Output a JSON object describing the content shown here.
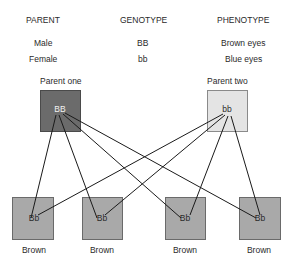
{
  "table": {
    "headers": [
      "PARENT",
      "GENOTYPE",
      "PHENOTYPE"
    ],
    "rows": [
      {
        "parent": "Male",
        "genotype": "BB",
        "phenotype": "Brown eyes"
      },
      {
        "parent": "Female",
        "genotype": "bb",
        "phenotype": "Blue eyes"
      }
    ]
  },
  "parents": [
    {
      "label": "Parent one",
      "genotype": "BB",
      "color": "#6b6b6b"
    },
    {
      "label": "Parent two",
      "genotype": "bb",
      "color": "#e4e4e4"
    }
  ],
  "offspring": [
    {
      "genotype": "Bb",
      "phenotype": "Brown",
      "color": "#a9a9a9"
    },
    {
      "genotype": "Bb",
      "phenotype": "Brown",
      "color": "#a9a9a9"
    },
    {
      "genotype": "Bb",
      "phenotype": "Brown",
      "color": "#a9a9a9"
    },
    {
      "genotype": "Bb",
      "phenotype": "Brown",
      "color": "#a9a9a9"
    }
  ]
}
